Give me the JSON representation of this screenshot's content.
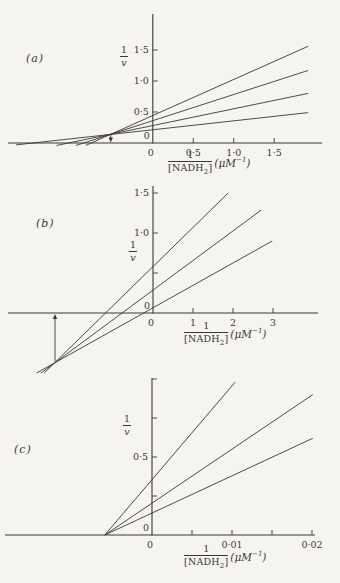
{
  "colors": {
    "ink": "#3b3833",
    "background": "#f5f4f1"
  },
  "chart_data": [
    {
      "panel": "a",
      "panel_label": "(a)",
      "type": "line",
      "title": "",
      "ylabel": {
        "numerator": "1",
        "denominator": "v"
      },
      "xlabel": {
        "numerator": "1",
        "den_main": "[NADH",
        "den_sub": "2",
        "den_end": "]",
        "unit_main": "(μM",
        "unit_sup": "−1",
        "unit_end": ")"
      },
      "xlim": [
        -1.8,
        2.09
      ],
      "ylim": [
        -0.16,
        2.08
      ],
      "x_ticks": [
        {
          "v": 0.5,
          "label": "0·5"
        },
        {
          "v": 1.0,
          "label": "1·0"
        },
        {
          "v": 1.5,
          "label": "1·5"
        }
      ],
      "y_ticks": [
        {
          "v": 0.5,
          "label": "0·5"
        },
        {
          "v": 1.0,
          "label": "1·0"
        },
        {
          "v": 1.5,
          "label": "1·5"
        }
      ],
      "origin_label_x": "0",
      "origin_label_y": "0",
      "lines": [
        {
          "x1": -0.83,
          "y1": -0.04,
          "x2": 1.92,
          "y2": 1.56
        },
        {
          "x1": -0.95,
          "y1": -0.04,
          "x2": 1.92,
          "y2": 1.17
        },
        {
          "x1": -1.19,
          "y1": -0.04,
          "x2": 1.92,
          "y2": 0.8
        },
        {
          "x1": -1.69,
          "y1": -0.03,
          "x2": 1.92,
          "y2": 0.49
        }
      ],
      "common_intersection": {
        "x": -0.52,
        "y": 0.14
      },
      "arrow": {
        "x": -0.52,
        "y_from": 0.13,
        "y_to": 0,
        "direction": "down"
      }
    },
    {
      "panel": "b",
      "panel_label": "(b)",
      "type": "line",
      "title": "",
      "ylabel": {
        "numerator": "1",
        "denominator": "v"
      },
      "xlabel": {
        "numerator": "1",
        "den_main": "[NADH",
        "den_sub": "2",
        "den_end": "]",
        "unit_main": "(μM",
        "unit_sup": "−1",
        "unit_end": ")"
      },
      "xlim": [
        -3.6,
        4.1
      ],
      "ylim": [
        -0.8,
        1.6
      ],
      "x_ticks": [
        {
          "v": 1,
          "label": "1"
        },
        {
          "v": 2,
          "label": "2"
        },
        {
          "v": 3,
          "label": "3"
        }
      ],
      "y_ticks": [
        {
          "v": 0.5,
          "label": ""
        },
        {
          "v": 1.0,
          "label": "1·0"
        },
        {
          "v": 1.5,
          "label": "1·5"
        }
      ],
      "origin_label_x": "0",
      "origin_label_y": "0",
      "lines": [
        {
          "x1": -2.72,
          "y1": -0.75,
          "x2": 1.88,
          "y2": 1.5
        },
        {
          "x1": -2.8,
          "y1": -0.75,
          "x2": 2.7,
          "y2": 1.285
        },
        {
          "x1": -2.91,
          "y1": -0.75,
          "x2": 2.98,
          "y2": 0.9
        }
      ],
      "common_intersection": {
        "x": -2.45,
        "y": -0.62
      },
      "arrow": {
        "x": -2.45,
        "y_from": -0.6,
        "y_to": 0,
        "direction": "up"
      }
    },
    {
      "panel": "c",
      "panel_label": "(c)",
      "type": "line",
      "title": "",
      "ylabel": {
        "numerator": "1",
        "denominator": "v"
      },
      "xlabel": {
        "numerator": "1",
        "den_main": "[NADH",
        "den_sub": "2",
        "den_end": "]",
        "unit_main": "(μM",
        "unit_sup": "−1",
        "unit_end": ")"
      },
      "xlim": [
        -0.0184,
        0.0204
      ],
      "ylim": [
        0,
        1.0
      ],
      "x_ticks": [
        {
          "v": 0.005,
          "label": ""
        },
        {
          "v": 0.01,
          "label": "0·01"
        },
        {
          "v": 0.015,
          "label": ""
        },
        {
          "v": 0.02,
          "label": "0·02"
        }
      ],
      "y_ticks": [
        {
          "v": 0.25,
          "label": ""
        },
        {
          "v": 0.5,
          "label": "0·5"
        },
        {
          "v": 0.75,
          "label": ""
        },
        {
          "v": 1.0,
          "label": ""
        }
      ],
      "origin_label_x": "0",
      "origin_label_y": "0",
      "lines": [
        {
          "x1": -0.0059,
          "y1": 0,
          "x2": 0.0104,
          "y2": 0.98
        },
        {
          "x1": -0.0059,
          "y1": 0,
          "x2": 0.0201,
          "y2": 0.9
        },
        {
          "x1": -0.0059,
          "y1": 0,
          "x2": 0.0201,
          "y2": 0.62
        }
      ],
      "common_intersection": {
        "x": -0.0059,
        "y": 0
      },
      "arrow": null
    }
  ]
}
